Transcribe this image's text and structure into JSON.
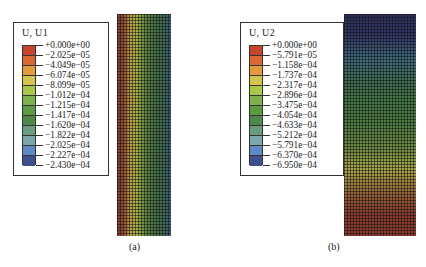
{
  "panels": [
    {
      "id": "a",
      "caption": "(a)",
      "legend": {
        "title": "U, U1",
        "values": [
          "+0.000e+00",
          "−2.025e−05",
          "−4.049e−05",
          "−6.074e−05",
          "−8.099e−05",
          "−1.012e−04",
          "−1.215e−04",
          "−1.417e−04",
          "−1.620e−04",
          "−1.822e−04",
          "−2.025e−04",
          "−2.227e−04",
          "−2.430e−04"
        ],
        "colors": [
          "#c8442f",
          "#d9672f",
          "#e39c3a",
          "#d4c64a",
          "#a9c848",
          "#7fb14a",
          "#5d9a44",
          "#4d8a48",
          "#6a9c80",
          "#7aa8a8",
          "#5e8ac4",
          "#3d4f8f"
        ]
      },
      "contour": {
        "direction": "horizontal",
        "gradient": [
          "#8a3a2a",
          "#9a5030",
          "#b9a040",
          "#a8b048",
          "#6e9040",
          "#4f7e40",
          "#467048",
          "#3e6a55",
          "#3d5a7a"
        ]
      }
    },
    {
      "id": "b",
      "caption": "(b)",
      "legend": {
        "title": "U, U2",
        "values": [
          "+0.000e+00",
          "−5.791e−05",
          "−1.158e−04",
          "−1.737e−04",
          "−2.317e−04",
          "−2.896e−04",
          "−3.475e−04",
          "−4.054e−04",
          "−4.633e−04",
          "−5.212e−04",
          "−5.791e−04",
          "−6.370e−04",
          "−6.950e−04"
        ],
        "colors": [
          "#c8442f",
          "#d9672f",
          "#e39c3a",
          "#d4c64a",
          "#a9c848",
          "#7fb14a",
          "#5d9a44",
          "#4d8a48",
          "#6a9c80",
          "#7aa8a8",
          "#5e8ac4",
          "#3d4f8f"
        ]
      },
      "contour": {
        "direction": "vertical",
        "gradient": [
          "#2e2f5e",
          "#33376a",
          "#3e6a80",
          "#3f6f55",
          "#467a45",
          "#4f8040",
          "#6e8c40",
          "#a8a848",
          "#9a6a38",
          "#8a3a2a",
          "#8f3a2e"
        ]
      }
    }
  ]
}
